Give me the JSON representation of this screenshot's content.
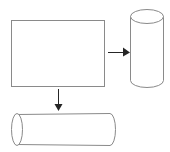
{
  "figure": {
    "background_color": "#ffffff",
    "outline_color": "#8a8a8a",
    "arrow_color": "#262626",
    "shapes": [
      {
        "id": "rectangle",
        "name": "rectangle",
        "label": "",
        "x": 11,
        "y": 20,
        "width": 94,
        "height": 67
      },
      {
        "id": "cylinder-vertical",
        "name": "vertical-cylinder",
        "label": "",
        "x": 130,
        "y": 9,
        "width": 33,
        "height": 79,
        "cap_height": 14
      },
      {
        "id": "cylinder-horizontal",
        "name": "horizontal-cylinder",
        "label": "",
        "x": 11,
        "y": 113,
        "width": 104,
        "height": 32,
        "cap_width": 11
      }
    ],
    "arrows": [
      {
        "id": "arrow-right",
        "name": "arrow-to-vertical-cylinder",
        "direction": "right",
        "label": "",
        "from_x": 108,
        "from_y": 52,
        "to_x": 130,
        "to_y": 52
      },
      {
        "id": "arrow-down",
        "name": "arrow-to-horizontal-cylinder",
        "direction": "down",
        "label": "",
        "from_x": 58,
        "from_y": 89,
        "to_x": 58,
        "to_y": 111
      }
    ]
  }
}
